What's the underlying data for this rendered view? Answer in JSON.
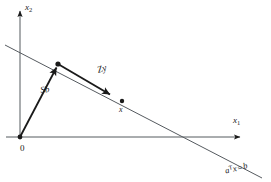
{
  "figure": {
    "background_color": "#ffffff",
    "ink_color": "#1a1a1a",
    "axes": {
      "x_axis_label": "x",
      "x_axis_subscript": "1",
      "y_axis_label": "x",
      "y_axis_subscript": "2",
      "origin_label": "0"
    },
    "vectors": [
      {
        "name": "particular-solution-vector",
        "label": "Sb",
        "from": [
          20,
          137
        ],
        "to": [
          58,
          64
        ],
        "description": "arrow from origin to a point on the constraint line"
      },
      {
        "name": "null-space-vector",
        "label": "Zy",
        "from": [
          58,
          64
        ],
        "to": [
          115,
          98
        ],
        "description": "arrow along the constraint line toward the solution point x"
      }
    ],
    "points": [
      {
        "name": "sb-endpoint",
        "label": "",
        "at": [
          58,
          64
        ]
      },
      {
        "name": "solution-point",
        "label": "x",
        "at": [
          122,
          101
        ]
      }
    ],
    "constraint_line": {
      "name": "constraint-line",
      "label_base": "a",
      "label_transpose": "T",
      "label_variable": "x",
      "label_equals": "=",
      "label_rhs": "b",
      "label_full": "aTx = b",
      "from": [
        5,
        45
      ],
      "to": [
        262,
        178
      ]
    }
  }
}
